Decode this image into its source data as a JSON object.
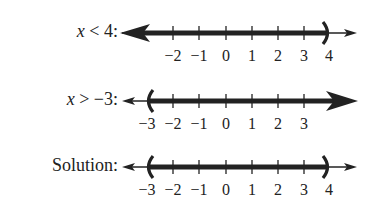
{
  "rows": [
    {
      "label_var": "x",
      "label_rest": " < 4:",
      "tick_labels": [
        "−2",
        "−1",
        "0",
        "1",
        "2",
        "3",
        "4"
      ],
      "shaded": "left-ray",
      "open_endpoint": "4"
    },
    {
      "label_var": "x",
      "label_rest": " > −3:",
      "tick_labels": [
        "−3",
        "−2",
        "−1",
        "0",
        "1",
        "2",
        "3"
      ],
      "shaded": "right-ray",
      "open_endpoint": "−3"
    },
    {
      "label_var": "",
      "label_rest": "Solution:",
      "tick_labels": [
        "−3",
        "−2",
        "−1",
        "0",
        "1",
        "2",
        "3",
        "4"
      ],
      "shaded": "interval",
      "open_endpoints": [
        "−3",
        "4"
      ]
    }
  ],
  "colors": {
    "ink": "#222222",
    "background": "#ffffff"
  }
}
